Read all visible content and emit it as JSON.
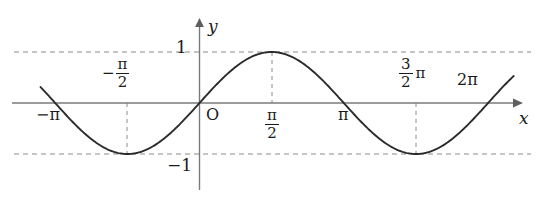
{
  "figure": {
    "kind": "cartesian-plot",
    "background_color": "#ffffff",
    "curve_color": "#2b2b2b",
    "axis_color": "#7a7a7a",
    "dash_color": "#8a8a8a"
  },
  "axes": {
    "x_axis_label": "x",
    "y_axis_label": "y",
    "origin_label": "O"
  },
  "y_ticks": [
    {
      "name": "one",
      "value": 1,
      "text": "1"
    },
    {
      "name": "minus-one",
      "value": -1,
      "minus": "−",
      "text": "1"
    }
  ],
  "x_ticks": [
    {
      "name": "minus-pi",
      "value": -3.14159,
      "minus": "−",
      "text": "π",
      "kind": "plain",
      "side": "below"
    },
    {
      "name": "minus-pi-over-two",
      "value": -1.5708,
      "minus": "−",
      "numerator": "π",
      "denominator": "2",
      "kind": "fraction",
      "side": "above"
    },
    {
      "name": "pi-over-two",
      "value": 1.5708,
      "numerator": "π",
      "denominator": "2",
      "kind": "fraction",
      "side": "below"
    },
    {
      "name": "pi",
      "value": 3.14159,
      "text": "π",
      "kind": "plain",
      "side": "below"
    },
    {
      "name": "three-pi-over-two",
      "value": 4.71239,
      "numerator": "3",
      "denominator": "2",
      "suffix": "π",
      "kind": "fraction",
      "side": "above"
    },
    {
      "name": "two-pi",
      "value": 6.28319,
      "text": "2π",
      "kind": "plain",
      "side": "above"
    }
  ],
  "guides": {
    "horizontal_dashed": [
      1,
      -1
    ],
    "vertical_dashed": [
      -1.5708,
      1.5708,
      4.71239
    ]
  },
  "chart_data": {
    "type": "line",
    "title": "",
    "xlabel": "x",
    "ylabel": "y",
    "grid": false,
    "legend": "none",
    "xlim": [
      -3.46,
      6.84
    ],
    "ylim": [
      -1.63,
      1.63
    ],
    "series": [
      {
        "name": "y = sin(x)",
        "expression": "sin(x)",
        "amplitude": 1,
        "period": 6.28319,
        "x": [
          -3.46,
          -3.14159,
          -2.5,
          -1.5708,
          -0.7854,
          0,
          0.7854,
          1.5708,
          2.35619,
          3.14159,
          3.92699,
          4.71239,
          5.49779,
          6.28319,
          6.84
        ],
        "values": [
          0.312,
          0,
          -0.599,
          -1,
          -0.707,
          0,
          0.707,
          1,
          0.707,
          0,
          -0.707,
          -1,
          -0.707,
          0,
          0.553
        ]
      }
    ],
    "annotations": [
      {
        "name": "max-at-pi-over-two",
        "x": 1.5708,
        "y": 1
      },
      {
        "name": "min-at-minus-pi-over-two",
        "x": -1.5708,
        "y": -1
      },
      {
        "name": "min-at-three-pi-over-two",
        "x": 4.71239,
        "y": -1
      }
    ],
    "xticklabels": [
      "−π",
      "−π/2",
      "π/2",
      "π",
      "3π/2",
      "2π"
    ],
    "yticklabels": [
      "1",
      "−1"
    ]
  }
}
